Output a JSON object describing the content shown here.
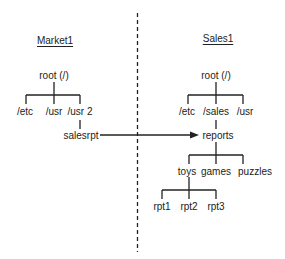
{
  "diagram": {
    "left": {
      "title": "Market1",
      "root": "root (/)",
      "children": [
        "/etc",
        "/usr",
        "/usr 2"
      ],
      "mount_point": "salesrpt"
    },
    "right": {
      "title": "Sales1",
      "root": "root (/)",
      "children": [
        "/etc",
        "/sales",
        "/usr"
      ],
      "reports": "reports",
      "report_children": [
        "toys",
        "games",
        "puzzles"
      ],
      "toys_children": [
        "rpt1",
        "rpt2",
        "rpt3"
      ]
    },
    "connection": {
      "from": "salesrpt",
      "to": "reports",
      "type": "arrow"
    },
    "colors": {
      "line": "#222222",
      "divider": "#222222"
    }
  }
}
